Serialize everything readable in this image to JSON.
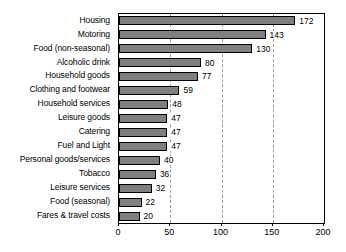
{
  "chart_data": {
    "type": "bar",
    "orientation": "horizontal",
    "title": "",
    "subtitle": "",
    "xlabel": "",
    "ylabel": "",
    "xlim": [
      0,
      200
    ],
    "xticks": [
      0,
      50,
      100,
      150,
      200
    ],
    "xtick_labels": [
      "0",
      "50",
      "100",
      "150",
      "200"
    ],
    "grid": "vertical-dashed",
    "legend": "none",
    "bar_color": "#7f7f7f",
    "bar_edge_color": "#000000",
    "value_labels_shown": true,
    "categories": [
      "Housing",
      "Motoring",
      "Food (non-seasonal)",
      "Alcoholic drink",
      "Household goods",
      "Clothing and footwear",
      "Household services",
      "Leisure goods",
      "Catering",
      "Fuel and Light",
      "Personal goods/services",
      "Tobacco",
      "Leisure services",
      "Food (seasonal)",
      "Fares & travel costs"
    ],
    "values": [
      172,
      143,
      130,
      80,
      77,
      59,
      48,
      47,
      47,
      47,
      40,
      36,
      32,
      22,
      20
    ],
    "value_label_texts": [
      "172",
      "143",
      "130",
      "80",
      "77",
      "59",
      "48",
      "47",
      "47",
      "47",
      "40",
      "36",
      "32",
      "22",
      "20"
    ]
  }
}
